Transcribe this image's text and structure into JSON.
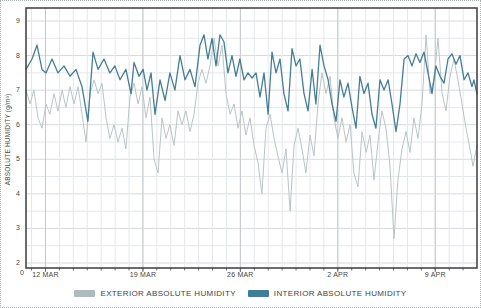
{
  "chart": {
    "y_axis_title": "ABSOLUTE HUMIDITY (g/m³)",
    "origin_label": "0",
    "legend": [
      {
        "label": "EXTERIOR ABSOLUTE HUMIDITY",
        "color": "#aebcc0"
      },
      {
        "label": "INTERIOR ABSOLUTE HUMIDITY",
        "color": "#3e7e98"
      }
    ]
  },
  "chart_data": {
    "type": "line",
    "title": "",
    "xlabel": "",
    "ylabel": "ABSOLUTE HUMIDITY (g/m³)",
    "ylim": [
      2,
      9
    ],
    "y_tick_step": 1,
    "y_minor_step": 0.5,
    "y_tick_labels": [
      "9",
      "8",
      "7",
      "6",
      "5",
      "4",
      "3",
      "2"
    ],
    "x_span_days": 32.4,
    "x_tick_days": [
      1.4,
      8.4,
      15.4,
      22.4,
      29.4
    ],
    "x_tick_labels": [
      "12 MAR",
      "19 MAR",
      "26 MAR",
      "2 APR",
      "9 APR"
    ],
    "grid": true,
    "legend_position": "bottom",
    "colors": {
      "grid_minor": "#e4e7e9",
      "grid_major_h": "#d6dadc",
      "grid_week_v": "#c3c8ca",
      "plot_border": "#3b3b3b",
      "axis_tick": "#6f6f6f"
    },
    "series": [
      {
        "name": "EXTERIOR ABSOLUTE HUMIDITY",
        "color": "#b9c4c7",
        "width": 1,
        "points": [
          [
            0,
            7.0
          ],
          [
            0.29,
            6.6
          ],
          [
            0.57,
            7.0
          ],
          [
            0.86,
            6.2
          ],
          [
            1.15,
            5.9
          ],
          [
            1.44,
            6.6
          ],
          [
            1.72,
            6.3
          ],
          [
            2.01,
            6.9
          ],
          [
            2.3,
            6.4
          ],
          [
            2.59,
            7.0
          ],
          [
            2.87,
            6.5
          ],
          [
            3.16,
            7.1
          ],
          [
            3.45,
            6.6
          ],
          [
            3.74,
            7.1
          ],
          [
            4.02,
            6.3
          ],
          [
            4.31,
            5.5
          ],
          [
            4.6,
            6.9
          ],
          [
            4.89,
            7.3
          ],
          [
            5.17,
            6.9
          ],
          [
            5.46,
            7.2
          ],
          [
            5.75,
            6.2
          ],
          [
            6.03,
            5.6
          ],
          [
            6.32,
            6.0
          ],
          [
            6.61,
            5.5
          ],
          [
            6.9,
            5.9
          ],
          [
            7.18,
            5.3
          ],
          [
            7.47,
            6.8
          ],
          [
            7.76,
            7.2
          ],
          [
            8.05,
            6.6
          ],
          [
            8.33,
            7.1
          ],
          [
            8.62,
            6.2
          ],
          [
            8.91,
            6.8
          ],
          [
            9.2,
            5.0
          ],
          [
            9.48,
            4.6
          ],
          [
            9.77,
            6.2
          ],
          [
            10.06,
            5.6
          ],
          [
            10.34,
            6.0
          ],
          [
            10.63,
            5.4
          ],
          [
            10.92,
            6.4
          ],
          [
            11.21,
            6.0
          ],
          [
            11.49,
            6.4
          ],
          [
            11.78,
            5.8
          ],
          [
            12.07,
            6.3
          ],
          [
            12.36,
            7.2
          ],
          [
            12.64,
            7.6
          ],
          [
            12.93,
            7.2
          ],
          [
            13.22,
            7.7
          ],
          [
            13.51,
            8.5
          ],
          [
            13.79,
            7.7
          ],
          [
            14.08,
            8.3
          ],
          [
            14.37,
            6.9
          ],
          [
            14.66,
            6.3
          ],
          [
            14.94,
            6.6
          ],
          [
            15.23,
            5.9
          ],
          [
            15.52,
            6.4
          ],
          [
            15.8,
            5.7
          ],
          [
            16.09,
            6.2
          ],
          [
            16.38,
            5.4
          ],
          [
            16.67,
            4.9
          ],
          [
            16.95,
            4.0
          ],
          [
            17.24,
            5.9
          ],
          [
            17.53,
            6.3
          ],
          [
            17.82,
            5.6
          ],
          [
            18.1,
            5.1
          ],
          [
            18.39,
            4.6
          ],
          [
            18.68,
            5.3
          ],
          [
            18.97,
            3.5
          ],
          [
            19.25,
            5.4
          ],
          [
            19.54,
            5.9
          ],
          [
            19.83,
            5.3
          ],
          [
            20.11,
            4.6
          ],
          [
            20.4,
            5.7
          ],
          [
            20.69,
            5.1
          ],
          [
            20.98,
            6.6
          ],
          [
            21.26,
            7.5
          ],
          [
            21.55,
            6.9
          ],
          [
            21.84,
            7.4
          ],
          [
            22.13,
            6.2
          ],
          [
            22.41,
            5.6
          ],
          [
            22.7,
            6.2
          ],
          [
            22.99,
            5.5
          ],
          [
            23.28,
            6.0
          ],
          [
            23.56,
            4.6
          ],
          [
            23.85,
            4.2
          ],
          [
            24.14,
            5.8
          ],
          [
            24.43,
            5.2
          ],
          [
            24.71,
            5.7
          ],
          [
            25.0,
            4.4
          ],
          [
            25.29,
            5.5
          ],
          [
            25.57,
            6.4
          ],
          [
            25.86,
            5.9
          ],
          [
            26.15,
            4.8
          ],
          [
            26.44,
            2.7
          ],
          [
            26.72,
            4.4
          ],
          [
            27.01,
            5.3
          ],
          [
            27.3,
            5.8
          ],
          [
            27.59,
            5.2
          ],
          [
            27.87,
            6.2
          ],
          [
            28.16,
            5.6
          ],
          [
            28.45,
            6.6
          ],
          [
            28.74,
            8.6
          ],
          [
            29.02,
            6.9
          ],
          [
            29.31,
            7.3
          ],
          [
            29.6,
            8.5
          ],
          [
            29.89,
            6.9
          ],
          [
            30.17,
            6.4
          ],
          [
            30.46,
            7.4
          ],
          [
            30.75,
            7.9
          ],
          [
            31.03,
            7.3
          ],
          [
            31.32,
            6.6
          ],
          [
            31.61,
            5.9
          ],
          [
            31.9,
            5.3
          ],
          [
            32.11,
            4.8
          ],
          [
            32.4,
            5.4
          ]
        ]
      },
      {
        "name": "INTERIOR ABSOLUTE HUMIDITY",
        "color": "#447d96",
        "width": 1.3,
        "points": [
          [
            0,
            7.6
          ],
          [
            0.43,
            7.9
          ],
          [
            0.79,
            8.3
          ],
          [
            1.15,
            7.6
          ],
          [
            1.44,
            7.5
          ],
          [
            1.87,
            7.9
          ],
          [
            2.3,
            7.5
          ],
          [
            2.73,
            7.7
          ],
          [
            3.16,
            7.4
          ],
          [
            3.59,
            7.6
          ],
          [
            4.02,
            7.1
          ],
          [
            4.45,
            6.1
          ],
          [
            4.81,
            8.1
          ],
          [
            5.17,
            7.6
          ],
          [
            5.6,
            7.9
          ],
          [
            6.03,
            7.5
          ],
          [
            6.39,
            7.7
          ],
          [
            6.75,
            7.3
          ],
          [
            7.18,
            7.6
          ],
          [
            7.54,
            6.9
          ],
          [
            7.76,
            7.8
          ],
          [
            8.12,
            7.4
          ],
          [
            8.41,
            7.6
          ],
          [
            8.69,
            7.0
          ],
          [
            8.98,
            7.5
          ],
          [
            9.27,
            6.3
          ],
          [
            9.63,
            7.3
          ],
          [
            9.99,
            6.7
          ],
          [
            10.34,
            7.5
          ],
          [
            10.7,
            7.0
          ],
          [
            11.06,
            8.0
          ],
          [
            11.42,
            7.3
          ],
          [
            11.78,
            7.6
          ],
          [
            12.14,
            7.1
          ],
          [
            12.5,
            8.3
          ],
          [
            12.79,
            8.6
          ],
          [
            13.07,
            7.9
          ],
          [
            13.36,
            8.5
          ],
          [
            13.65,
            7.7
          ],
          [
            13.94,
            8.6
          ],
          [
            14.22,
            8.4
          ],
          [
            14.51,
            7.5
          ],
          [
            14.8,
            8.0
          ],
          [
            15.09,
            7.4
          ],
          [
            15.37,
            7.9
          ],
          [
            15.66,
            7.3
          ],
          [
            15.95,
            7.5
          ],
          [
            16.24,
            7.35
          ],
          [
            16.52,
            7.5
          ],
          [
            16.81,
            6.8
          ],
          [
            17.1,
            7.5
          ],
          [
            17.39,
            6.3
          ],
          [
            17.67,
            8.1
          ],
          [
            17.96,
            7.5
          ],
          [
            18.25,
            7.9
          ],
          [
            18.53,
            6.9
          ],
          [
            18.82,
            6.4
          ],
          [
            19.11,
            8.2
          ],
          [
            19.4,
            7.7
          ],
          [
            19.68,
            7.9
          ],
          [
            19.97,
            6.9
          ],
          [
            20.26,
            6.4
          ],
          [
            20.55,
            7.6
          ],
          [
            20.83,
            6.6
          ],
          [
            21.12,
            8.3
          ],
          [
            21.41,
            7.7
          ],
          [
            21.7,
            7.3
          ],
          [
            21.98,
            6.6
          ],
          [
            22.27,
            6.1
          ],
          [
            22.56,
            7.3
          ],
          [
            22.84,
            6.8
          ],
          [
            23.13,
            7.2
          ],
          [
            23.42,
            6.5
          ],
          [
            23.71,
            5.9
          ],
          [
            23.99,
            7.4
          ],
          [
            24.28,
            6.9
          ],
          [
            24.57,
            7.2
          ],
          [
            24.86,
            6.3
          ],
          [
            25.14,
            5.9
          ],
          [
            25.43,
            7.3
          ],
          [
            25.72,
            7.0
          ],
          [
            26.01,
            7.3
          ],
          [
            26.29,
            6.6
          ],
          [
            26.58,
            5.8
          ],
          [
            26.87,
            6.6
          ],
          [
            27.16,
            7.9
          ],
          [
            27.44,
            8.0
          ],
          [
            27.73,
            7.7
          ],
          [
            28.02,
            8.05
          ],
          [
            28.3,
            7.8
          ],
          [
            28.59,
            8.1
          ],
          [
            28.88,
            7.5
          ],
          [
            29.17,
            6.9
          ],
          [
            29.45,
            7.7
          ],
          [
            29.74,
            7.4
          ],
          [
            30.03,
            7.2
          ],
          [
            30.32,
            7.9
          ],
          [
            30.6,
            8.05
          ],
          [
            30.89,
            7.75
          ],
          [
            31.18,
            8.0
          ],
          [
            31.47,
            7.3
          ],
          [
            31.75,
            7.5
          ],
          [
            32.04,
            7.1
          ],
          [
            32.18,
            7.3
          ],
          [
            32.4,
            6.9
          ]
        ]
      }
    ]
  }
}
